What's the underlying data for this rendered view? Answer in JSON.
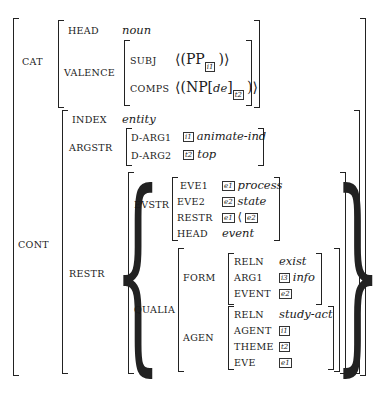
{
  "avm": {
    "cat": {
      "label": "CAT",
      "head": {
        "label": "HEAD",
        "value": "noun"
      },
      "valence": {
        "label": "VALENCE",
        "subj": {
          "label": "SUBJ",
          "value": "⟨(PP",
          "tag": "i1",
          "close": ")⟩"
        },
        "comps": {
          "label": "COMPS",
          "value": "⟨(NP[",
          "de": "de",
          "close1": "]",
          "tag": "t2",
          "close": ")⟩"
        }
      }
    },
    "cont": {
      "label": "CONT",
      "index": {
        "label": "INDEX",
        "value": "entity"
      },
      "argstr": {
        "label": "ARGSTR",
        "darg1": {
          "label": "D-ARG1",
          "tag": "i1",
          "value": "animate-ind"
        },
        "darg2": {
          "label": "D-ARG2",
          "tag": "t2",
          "value": "top"
        }
      },
      "restr": {
        "label": "RESTR",
        "evstr": {
          "label": "EVSTR",
          "eve1": {
            "label": "EVE1",
            "tag": "e1",
            "value": "process"
          },
          "eve2": {
            "label": "EVE2",
            "tag": "e2",
            "value": "state"
          },
          "restr": {
            "label": "RESTR",
            "tag1": "e1",
            "op": "⟨",
            "tag2": "e2"
          },
          "head": {
            "label": "HEAD",
            "value": "event"
          }
        },
        "qualia": {
          "label": "QUALIA",
          "form": {
            "label": "FORM",
            "reln": {
              "label": "RELN",
              "value": "exist"
            },
            "arg1": {
              "label": "ARG1",
              "tag": "i3",
              "value": "info"
            },
            "event": {
              "label": "EVENT",
              "tag": "e2"
            }
          },
          "agen": {
            "label": "AGEN",
            "reln": {
              "label": "RELN",
              "value": "study-act"
            },
            "agent": {
              "label": "AGENT",
              "tag": "i1"
            },
            "theme": {
              "label": "THEME",
              "tag": "t2"
            },
            "eve": {
              "label": "EVE",
              "tag": "e1"
            }
          }
        }
      }
    }
  }
}
